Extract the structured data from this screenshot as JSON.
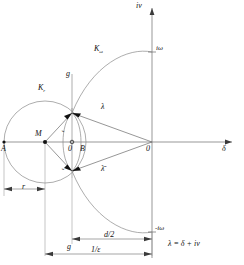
{
  "figure": {
    "type": "complex-plane-stability-diagram",
    "equation": "λ = δ + iν"
  },
  "axes": {
    "vertical_label": "iν",
    "horizontal_label": "δ",
    "origin_label": "0"
  },
  "curves": {
    "circle_r_label": "K",
    "circle_r_sub": "r",
    "curve_omega_label": "K",
    "curve_omega_sub": "ω"
  },
  "points": {
    "a": "A",
    "m": "M",
    "o": "0",
    "b": "B",
    "origin": "0"
  },
  "markers": {
    "i_omega": "iω",
    "minus_i_omega": "-iω",
    "lambda": "λ",
    "lambda_conj": "λ̄",
    "g_top": "g",
    "epsilon_upper": "ε",
    "epsilon_lower": "ε"
  },
  "dimensions": {
    "r": "r",
    "g": "g",
    "d_half": "d/2",
    "one_over_eps": "1/ε"
  }
}
